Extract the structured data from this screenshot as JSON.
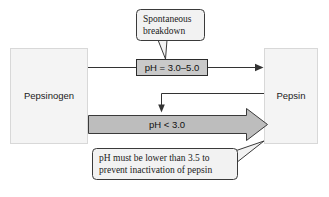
{
  "diagram": {
    "nodes": {
      "reactant": {
        "label": "Pepsinogen"
      },
      "product": {
        "label": "Pepsin"
      }
    },
    "conditions": {
      "spontaneous": {
        "label": "pH = 3.0–5.0"
      },
      "autocatalytic": {
        "label": "pH < 3.0"
      }
    },
    "callouts": {
      "top": {
        "line1": "Spontaneous",
        "line2": "breakdown"
      },
      "bottom": {
        "line1": "pH must be lower than 3.5 to",
        "line2": "prevent inactivation of pepsin"
      }
    },
    "colors": {
      "background": "#ffffff",
      "box_fill": "#f4f4f4",
      "ph_box_fill": "#c9c9c9",
      "block_arrow_fill": "#bdbdbd",
      "callout_fill": "#f2f2f2",
      "line": "#333333",
      "text": "#1a1a1a"
    }
  }
}
